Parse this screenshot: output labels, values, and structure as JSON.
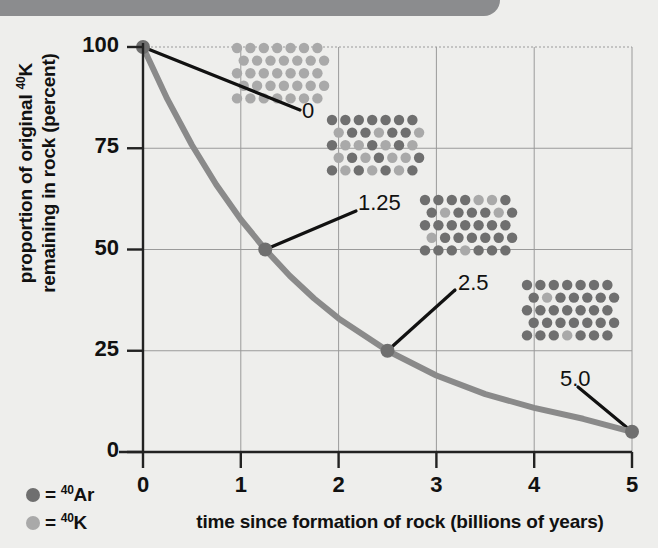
{
  "figure": {
    "background_color": "#eeeeec",
    "band_color": "#8b8c8e"
  },
  "chart_data": {
    "type": "line",
    "title": "",
    "xlabel": "time since formation of rock (billions of years)",
    "ylabel_line1": "proportion of original ⁴⁰K",
    "ylabel_line2": "remaining in rock (percent)",
    "xlim": [
      0,
      5
    ],
    "ylim": [
      0,
      100
    ],
    "xticks": [
      "0",
      "1",
      "2",
      "3",
      "4",
      "5"
    ],
    "xtick_values": [
      0,
      1,
      2,
      3,
      4,
      5
    ],
    "yticks": [
      "0",
      "25",
      "50",
      "75",
      "100"
    ],
    "ytick_values": [
      0,
      25,
      50,
      75,
      100
    ],
    "grid": true,
    "legend_position": "bottom-left",
    "series": [
      {
        "name": "proportion of original 40K remaining",
        "color": "#8a8a8a",
        "x": [
          0,
          0.25,
          0.5,
          0.75,
          1.0,
          1.25,
          1.5,
          1.75,
          2.0,
          2.5,
          3.0,
          3.5,
          4.0,
          4.5,
          5.0
        ],
        "values": [
          100,
          87.1,
          75.8,
          66.0,
          57.4,
          50.0,
          43.5,
          37.9,
          33.0,
          25.0,
          18.9,
          14.3,
          10.9,
          8.2,
          5.0
        ]
      }
    ],
    "markers": [
      {
        "label": "0",
        "x": 0,
        "y": 100
      },
      {
        "label": "1.25",
        "x": 1.25,
        "y": 50
      },
      {
        "label": "2.5",
        "x": 2.5,
        "y": 25
      },
      {
        "label": "5.0",
        "x": 5.0,
        "y": 5
      }
    ]
  },
  "legend": {
    "items": [
      {
        "dot": "ar-dot",
        "color": "#6f6f6f",
        "prefix": "= ",
        "sup": "40",
        "symbol": "Ar"
      },
      {
        "dot": "k-dot",
        "color": "#a9a9a9",
        "prefix": "= ",
        "sup": "40",
        "symbol": "K"
      }
    ]
  },
  "ticks": {
    "y": [
      {
        "label": "100",
        "value": 100
      },
      {
        "label": "75",
        "value": 75
      },
      {
        "label": "50",
        "value": 50
      },
      {
        "label": "25",
        "value": 25
      },
      {
        "label": "0",
        "value": 0
      }
    ],
    "x": [
      {
        "label": "0",
        "value": 0
      },
      {
        "label": "1",
        "value": 1
      },
      {
        "label": "2",
        "value": 2
      },
      {
        "label": "3",
        "value": 3
      },
      {
        "label": "4",
        "value": 4
      },
      {
        "label": "5",
        "value": 5
      }
    ]
  },
  "annotations": [
    {
      "name": "annotation-0",
      "label": "0",
      "k_percent": 100,
      "ar_percent": 0
    },
    {
      "name": "annotation-1-25",
      "label": "1.25",
      "k_percent": 50,
      "ar_percent": 50
    },
    {
      "name": "annotation-2-5",
      "label": "2.5",
      "k_percent": 25,
      "ar_percent": 75
    },
    {
      "name": "annotation-5-0",
      "label": "5.0",
      "k_percent": 5,
      "ar_percent": 95
    }
  ],
  "atom_grids": [
    {
      "name": "atom-grid-0",
      "for_time": "0",
      "x": 237,
      "y": 48,
      "cols": 7,
      "rows": 5,
      "k_count": 35,
      "ar_count": 0,
      "pattern": [
        [
          1,
          1,
          1,
          1,
          1,
          1,
          1
        ],
        [
          1,
          1,
          1,
          1,
          1,
          1,
          1
        ],
        [
          1,
          1,
          1,
          1,
          1,
          1,
          1
        ],
        [
          1,
          1,
          1,
          1,
          1,
          1,
          1
        ],
        [
          1,
          1,
          1,
          1,
          1,
          1,
          1
        ]
      ]
    },
    {
      "name": "atom-grid-1-25",
      "for_time": "1.25",
      "x": 332,
      "y": 120,
      "cols": 7,
      "rows": 5,
      "k_count": 17,
      "ar_count": 18,
      "pattern": [
        [
          0,
          0,
          0,
          0,
          0,
          0,
          0
        ],
        [
          1,
          0,
          0,
          1,
          0,
          0,
          1
        ],
        [
          0,
          1,
          1,
          0,
          1,
          0,
          1
        ],
        [
          1,
          0,
          1,
          0,
          1,
          1,
          0
        ],
        [
          0,
          1,
          0,
          1,
          0,
          1,
          0
        ]
      ]
    },
    {
      "name": "atom-grid-2-5",
      "for_time": "2.5",
      "x": 425,
      "y": 200,
      "cols": 7,
      "rows": 5,
      "k_count": 9,
      "ar_count": 26,
      "pattern": [
        [
          0,
          0,
          0,
          0,
          1,
          1,
          0
        ],
        [
          0,
          1,
          0,
          0,
          0,
          1,
          0
        ],
        [
          0,
          0,
          0,
          0,
          0,
          0,
          0
        ],
        [
          1,
          0,
          0,
          0,
          0,
          0,
          0
        ],
        [
          0,
          0,
          0,
          1,
          0,
          0,
          0
        ]
      ]
    },
    {
      "name": "atom-grid-5-0",
      "for_time": "5.0",
      "x": 527,
      "y": 285,
      "cols": 7,
      "rows": 5,
      "k_count": 2,
      "ar_count": 33,
      "pattern": [
        [
          0,
          0,
          0,
          0,
          0,
          0,
          0
        ],
        [
          0,
          1,
          0,
          0,
          0,
          0,
          0
        ],
        [
          0,
          0,
          0,
          0,
          0,
          0,
          0
        ],
        [
          0,
          0,
          0,
          0,
          0,
          0,
          0
        ],
        [
          0,
          0,
          0,
          1,
          0,
          0,
          0
        ]
      ]
    }
  ],
  "colors": {
    "curve": "#8a8a8a",
    "axis": "#222222",
    "grid": "#9a9a9a",
    "ar": "#6f6f6f",
    "k": "#a9a9a9",
    "leader": "#111111"
  }
}
